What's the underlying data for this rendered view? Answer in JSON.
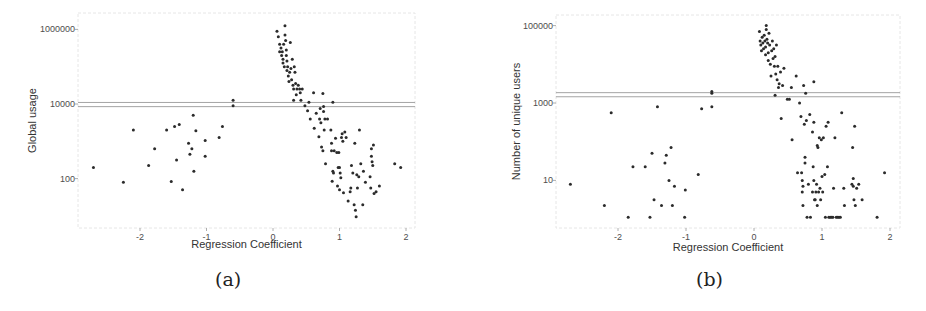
{
  "figure": {
    "captions": [
      "(a)",
      "(b)"
    ]
  },
  "colors": {
    "point": "#2b2b2b",
    "hline": "#9a9a9a",
    "axis_frame": "#e6e6e6",
    "tick_text": "#4d4d4d",
    "title_text": "#333333"
  },
  "chart_data": [
    {
      "type": "scatter",
      "id": "a",
      "caption": "(a)",
      "title": "",
      "xlabel": "Regression Coefficient",
      "ylabel": "Global usage",
      "yscale": "log10",
      "x_ticks": [
        -2,
        -1,
        0,
        1,
        2
      ],
      "x_tick_labels": [
        "-2",
        "-1",
        "0",
        "1",
        "2"
      ],
      "y_ticks": [
        100,
        10000,
        1000000
      ],
      "y_tick_labels": [
        "100",
        "10000",
        "1000000"
      ],
      "xlim": [
        -2.9,
        2.1
      ],
      "ylim_log10": [
        0.8,
        6.4
      ],
      "grid": false,
      "legend": null,
      "hlines": [
        11000,
        8500
      ],
      "points": [
        [
          -2.7,
          2.3
        ],
        [
          -2.25,
          1.9
        ],
        [
          -2.1,
          3.3
        ],
        [
          -1.87,
          2.35
        ],
        [
          -1.78,
          2.8
        ],
        [
          -1.6,
          3.3
        ],
        [
          -1.53,
          1.92
        ],
        [
          -1.48,
          3.4
        ],
        [
          -1.45,
          2.5
        ],
        [
          -1.41,
          3.45
        ],
        [
          -1.36,
          1.7
        ],
        [
          -1.27,
          2.95
        ],
        [
          -1.25,
          2.65
        ],
        [
          -1.22,
          2.8
        ],
        [
          -1.2,
          3.7
        ],
        [
          -1.19,
          2.2
        ],
        [
          -1.16,
          3.28
        ],
        [
          -1.02,
          3.02
        ],
        [
          -1.02,
          2.6
        ],
        [
          -0.81,
          3.1
        ],
        [
          -0.76,
          3.4
        ],
        [
          -0.6,
          4.1
        ],
        [
          -0.6,
          3.95
        ],
        [
          0.06,
          5.95
        ],
        [
          0.08,
          5.8
        ],
        [
          0.1,
          5.6
        ],
        [
          0.1,
          5.4
        ],
        [
          0.12,
          5.5
        ],
        [
          0.13,
          5.3
        ],
        [
          0.14,
          5.4
        ],
        [
          0.15,
          5.2
        ],
        [
          0.15,
          5.1
        ],
        [
          0.16,
          5.6
        ],
        [
          0.17,
          5.0
        ],
        [
          0.18,
          6.1
        ],
        [
          0.18,
          5.85
        ],
        [
          0.19,
          5.7
        ],
        [
          0.2,
          5.3
        ],
        [
          0.2,
          5.45
        ],
        [
          0.21,
          5.15
        ],
        [
          0.21,
          4.9
        ],
        [
          0.22,
          5.0
        ],
        [
          0.23,
          4.75
        ],
        [
          0.24,
          4.6
        ],
        [
          0.25,
          4.85
        ],
        [
          0.26,
          5.65
        ],
        [
          0.27,
          4.95
        ],
        [
          0.28,
          4.65
        ],
        [
          0.29,
          5.2
        ],
        [
          0.3,
          4.5
        ],
        [
          0.31,
          4.4
        ],
        [
          0.31,
          4.1
        ],
        [
          0.32,
          5.0
        ],
        [
          0.33,
          4.85
        ],
        [
          0.34,
          4.55
        ],
        [
          0.35,
          4.25
        ],
        [
          0.36,
          4.4
        ],
        [
          0.38,
          4.5
        ],
        [
          0.4,
          4.4
        ],
        [
          0.41,
          4.3
        ],
        [
          0.42,
          4.1
        ],
        [
          0.44,
          4.4
        ],
        [
          0.48,
          3.95
        ],
        [
          0.52,
          3.82
        ],
        [
          0.54,
          4.05
        ],
        [
          0.56,
          3.6
        ],
        [
          0.61,
          4.3
        ],
        [
          0.62,
          3.35
        ],
        [
          0.65,
          3.75
        ],
        [
          0.69,
          3.12
        ],
        [
          0.7,
          3.6
        ],
        [
          0.71,
          3.88
        ],
        [
          0.72,
          3.5
        ],
        [
          0.73,
          2.85
        ],
        [
          0.75,
          2.75
        ],
        [
          0.75,
          4.28
        ],
        [
          0.76,
          3.8
        ],
        [
          0.76,
          3.93
        ],
        [
          0.77,
          3.3
        ],
        [
          0.78,
          3.6
        ],
        [
          0.79,
          2.4
        ],
        [
          0.82,
          3.6
        ],
        [
          0.87,
          3.3
        ],
        [
          0.88,
          2.95
        ],
        [
          0.88,
          2.75
        ],
        [
          0.89,
          1.93
        ],
        [
          0.9,
          2.2
        ],
        [
          0.9,
          4.05
        ],
        [
          0.91,
          2.15
        ],
        [
          0.92,
          2.75
        ],
        [
          0.94,
          3.08
        ],
        [
          0.96,
          2.7
        ],
        [
          0.97,
          1.8
        ],
        [
          0.98,
          2.3
        ],
        [
          0.99,
          2.7
        ],
        [
          1.0,
          2.3
        ],
        [
          1.0,
          1.7
        ],
        [
          1.01,
          2.15
        ],
        [
          1.02,
          2.02
        ],
        [
          1.03,
          3.1
        ],
        [
          1.04,
          3.2
        ],
        [
          1.05,
          3.0
        ],
        [
          1.06,
          1.62
        ],
        [
          1.08,
          3.25
        ],
        [
          1.1,
          3.1
        ],
        [
          1.13,
          1.4
        ],
        [
          1.16,
          1.65
        ],
        [
          1.17,
          1.75
        ],
        [
          1.18,
          2.35
        ],
        [
          1.2,
          2.15
        ],
        [
          1.22,
          1.3
        ],
        [
          1.23,
          2.95
        ],
        [
          1.24,
          1.15
        ],
        [
          1.25,
          0.98
        ],
        [
          1.26,
          2.1
        ],
        [
          1.27,
          1.75
        ],
        [
          1.29,
          2.05
        ],
        [
          1.3,
          3.3
        ],
        [
          1.32,
          2.4
        ],
        [
          1.35,
          1.3
        ],
        [
          1.36,
          2.2
        ],
        [
          1.39,
          1.9
        ],
        [
          1.46,
          2.05
        ],
        [
          1.47,
          1.75
        ],
        [
          1.48,
          2.6
        ],
        [
          1.48,
          2.8
        ],
        [
          1.49,
          2.45
        ],
        [
          1.5,
          2.35
        ],
        [
          1.51,
          2.9
        ],
        [
          1.52,
          1.6
        ],
        [
          1.55,
          1.65
        ],
        [
          1.6,
          1.8
        ],
        [
          1.83,
          2.4
        ],
        [
          1.92,
          2.3
        ]
      ]
    },
    {
      "type": "scatter",
      "id": "b",
      "caption": "(b)",
      "title": "",
      "xlabel": "Regression Coefficient",
      "ylabel": "Number of unique users",
      "yscale": "log10",
      "x_ticks": [
        -2,
        -1,
        0,
        1,
        2
      ],
      "x_tick_labels": [
        "-2",
        "-1",
        "0",
        "1",
        "2"
      ],
      "y_ticks": [
        10,
        1000,
        100000
      ],
      "y_tick_labels": [
        "10",
        "1000",
        "100000"
      ],
      "xlim": [
        -2.95,
        2.1
      ],
      "ylim_log10": [
        0.45,
        5.25
      ],
      "grid": false,
      "legend": null,
      "hlines": [
        1850,
        1450
      ],
      "points": [
        [
          -2.7,
          0.9
        ],
        [
          -2.2,
          0.35
        ],
        [
          -2.1,
          2.75
        ],
        [
          -1.85,
          0.05
        ],
        [
          -1.78,
          1.35
        ],
        [
          -1.6,
          1.35
        ],
        [
          -1.53,
          0.05
        ],
        [
          -1.5,
          1.7
        ],
        [
          -1.47,
          0.5
        ],
        [
          -1.42,
          2.9
        ],
        [
          -1.36,
          0.35
        ],
        [
          -1.31,
          1.45
        ],
        [
          -1.29,
          1.65
        ],
        [
          -1.25,
          1.0
        ],
        [
          -1.22,
          1.85
        ],
        [
          -1.2,
          0.35
        ],
        [
          -1.17,
          0.85
        ],
        [
          -1.02,
          0.05
        ],
        [
          -1.01,
          0.75
        ],
        [
          -0.82,
          1.15
        ],
        [
          -0.77,
          2.85
        ],
        [
          -0.62,
          2.9
        ],
        [
          -0.62,
          3.25
        ],
        [
          -0.62,
          3.3
        ],
        [
          0.08,
          4.85
        ],
        [
          0.09,
          4.6
        ],
        [
          0.1,
          4.5
        ],
        [
          0.11,
          4.35
        ],
        [
          0.12,
          4.7
        ],
        [
          0.13,
          4.55
        ],
        [
          0.14,
          4.4
        ],
        [
          0.15,
          4.75
        ],
        [
          0.16,
          4.6
        ],
        [
          0.17,
          4.45
        ],
        [
          0.17,
          4.25
        ],
        [
          0.18,
          4.9
        ],
        [
          0.18,
          5.0
        ],
        [
          0.19,
          4.65
        ],
        [
          0.2,
          4.55
        ],
        [
          0.21,
          4.3
        ],
        [
          0.21,
          4.1
        ],
        [
          0.22,
          4.8
        ],
        [
          0.23,
          4.5
        ],
        [
          0.24,
          4.0
        ],
        [
          0.25,
          3.7
        ],
        [
          0.26,
          4.35
        ],
        [
          0.27,
          4.6
        ],
        [
          0.28,
          4.15
        ],
        [
          0.29,
          4.4
        ],
        [
          0.3,
          3.95
        ],
        [
          0.31,
          3.2
        ],
        [
          0.31,
          4.2
        ],
        [
          0.32,
          3.75
        ],
        [
          0.33,
          4.5
        ],
        [
          0.34,
          3.6
        ],
        [
          0.35,
          3.95
        ],
        [
          0.36,
          3.4
        ],
        [
          0.37,
          3.5
        ],
        [
          0.39,
          3.8
        ],
        [
          0.4,
          2.6
        ],
        [
          0.42,
          3.45
        ],
        [
          0.44,
          3.9
        ],
        [
          0.49,
          3.1
        ],
        [
          0.52,
          3.1
        ],
        [
          0.55,
          3.4
        ],
        [
          0.56,
          2.05
        ],
        [
          0.62,
          3.7
        ],
        [
          0.64,
          1.2
        ],
        [
          0.67,
          3.0
        ],
        [
          0.69,
          2.65
        ],
        [
          0.7,
          1.2
        ],
        [
          0.71,
          1.0
        ],
        [
          0.71,
          0.7
        ],
        [
          0.72,
          0.35
        ],
        [
          0.72,
          0.85
        ],
        [
          0.73,
          3.45
        ],
        [
          0.74,
          2.45
        ],
        [
          0.75,
          1.6
        ],
        [
          0.75,
          1.45
        ],
        [
          0.76,
          3.25
        ],
        [
          0.77,
          2.55
        ],
        [
          0.78,
          0.05
        ],
        [
          0.8,
          0.9
        ],
        [
          0.82,
          2.7
        ],
        [
          0.83,
          0.05
        ],
        [
          0.86,
          0.7
        ],
        [
          0.86,
          2.25
        ],
        [
          0.87,
          1.35
        ],
        [
          0.88,
          2.5
        ],
        [
          0.88,
          1.0
        ],
        [
          0.88,
          3.55
        ],
        [
          0.89,
          0.5
        ],
        [
          0.9,
          0.5
        ],
        [
          0.91,
          0.7
        ],
        [
          0.92,
          0.9
        ],
        [
          0.93,
          1.9
        ],
        [
          0.93,
          0.35
        ],
        [
          0.94,
          1.85
        ],
        [
          0.95,
          0.7
        ],
        [
          0.96,
          2.1
        ],
        [
          0.97,
          0.8
        ],
        [
          0.98,
          0.5
        ],
        [
          0.99,
          2.05
        ],
        [
          1.0,
          1.1
        ],
        [
          1.01,
          0.7
        ],
        [
          1.02,
          2.1
        ],
        [
          1.04,
          1.15
        ],
        [
          1.05,
          0.05
        ],
        [
          1.06,
          2.4
        ],
        [
          1.08,
          1.35
        ],
        [
          1.09,
          2.5
        ],
        [
          1.1,
          0.05
        ],
        [
          1.12,
          0.05
        ],
        [
          1.14,
          0.05
        ],
        [
          1.16,
          0.05
        ],
        [
          1.17,
          0.8
        ],
        [
          1.19,
          2.1
        ],
        [
          1.21,
          0.05
        ],
        [
          1.23,
          0.05
        ],
        [
          1.25,
          0.05
        ],
        [
          1.27,
          0.05
        ],
        [
          1.29,
          2.75
        ],
        [
          1.32,
          0.8
        ],
        [
          1.33,
          0.35
        ],
        [
          1.44,
          0.9
        ],
        [
          1.45,
          1.85
        ],
        [
          1.46,
          1.05
        ],
        [
          1.46,
          0.85
        ],
        [
          1.47,
          0.5
        ],
        [
          1.48,
          2.4
        ],
        [
          1.49,
          0.35
        ],
        [
          1.51,
          0.8
        ],
        [
          1.54,
          0.9
        ],
        [
          1.59,
          0.5
        ],
        [
          1.81,
          0.05
        ],
        [
          1.92,
          1.2
        ]
      ]
    }
  ]
}
